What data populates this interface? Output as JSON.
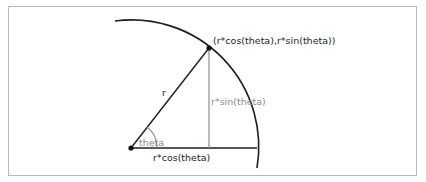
{
  "diagram": {
    "type": "polar-to-cartesian",
    "colors": {
      "frame": "#b8b8b8",
      "primary_line": "#1e1e1e",
      "secondary_line": "#8c8c8c",
      "primary_text": "#1e1e1e",
      "secondary_text": "#8c8c8c"
    },
    "labels": {
      "point": "(r*cos(theta),r*sin(theta))",
      "radius": "r",
      "opposite": "r*sin(theta)",
      "adjacent": "r*cos(theta)",
      "angle": "theta"
    },
    "nodes": [
      {
        "id": "origin",
        "x": 131,
        "y": 148
      },
      {
        "id": "point-on-circle",
        "x": 209,
        "y": 48
      }
    ],
    "edges": [
      {
        "from": "origin",
        "to": "point-on-circle",
        "label": "r"
      },
      {
        "from": "point-on-circle",
        "to": "foot",
        "label": "r*sin(theta)"
      },
      {
        "from": "origin",
        "to": "arc-end",
        "label": "r*cos(theta)"
      }
    ]
  }
}
